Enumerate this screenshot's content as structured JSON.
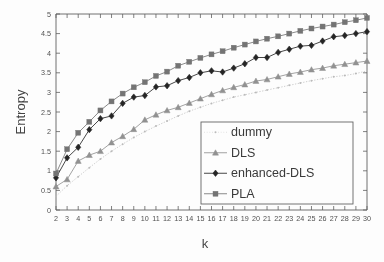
{
  "chart_data": {
    "type": "line",
    "title": "",
    "xlabel": "k",
    "ylabel": "Entropy",
    "xlim": [
      2,
      30
    ],
    "ylim": [
      0,
      5
    ],
    "grid": false,
    "legend_position": "bottom-right",
    "x": [
      2,
      3,
      4,
      5,
      6,
      7,
      8,
      9,
      10,
      11,
      12,
      13,
      14,
      15,
      16,
      17,
      18,
      19,
      20,
      21,
      22,
      23,
      24,
      25,
      26,
      27,
      28,
      29,
      30
    ],
    "xticklabels": [
      "2",
      "3",
      "4",
      "5",
      "6",
      "7",
      "8",
      "9",
      "10",
      "11",
      "12",
      "13",
      "14",
      "15",
      "16",
      "17",
      "18",
      "19",
      "20",
      "21",
      "22",
      "23",
      "24",
      "25",
      "26",
      "27",
      "28",
      "29",
      "30"
    ],
    "yticklabels": [
      "0",
      "0.5",
      "1",
      "1.5",
      "2",
      "2.5",
      "3",
      "3.5",
      "4",
      "4.5",
      "5"
    ],
    "yticks": [
      0,
      0.5,
      1,
      1.5,
      2,
      2.5,
      3,
      3.5,
      4,
      4.5,
      5
    ],
    "series": [
      {
        "name": "dummy",
        "marker": "dot",
        "color": "#b9b9b9",
        "linestyle": "dotted",
        "values": [
          0.35,
          0.62,
          0.85,
          1.08,
          1.3,
          1.5,
          1.68,
          1.85,
          2.0,
          2.14,
          2.27,
          2.4,
          2.52,
          2.62,
          2.72,
          2.8,
          2.88,
          2.94,
          3.0,
          3.06,
          3.12,
          3.18,
          3.24,
          3.3,
          3.35,
          3.4,
          3.43,
          3.48,
          3.55
        ]
      },
      {
        "name": "DLS",
        "marker": "triangle",
        "color": "#8e8e8e",
        "linestyle": "solid",
        "values": [
          0.6,
          0.78,
          1.25,
          1.4,
          1.5,
          1.72,
          1.88,
          2.06,
          2.3,
          2.43,
          2.54,
          2.62,
          2.73,
          2.84,
          2.95,
          3.05,
          3.13,
          3.2,
          3.29,
          3.33,
          3.4,
          3.47,
          3.52,
          3.58,
          3.62,
          3.68,
          3.72,
          3.76,
          3.8
        ]
      },
      {
        "name": "enhanced-DLS",
        "marker": "diamond",
        "color": "#1d1d1d",
        "linestyle": "solid",
        "values": [
          0.82,
          1.33,
          1.6,
          2.05,
          2.33,
          2.4,
          2.72,
          2.88,
          2.92,
          3.14,
          3.17,
          3.3,
          3.38,
          3.5,
          3.55,
          3.52,
          3.62,
          3.73,
          3.89,
          3.89,
          4.02,
          4.1,
          4.18,
          4.2,
          4.31,
          4.42,
          4.45,
          4.5,
          4.55
        ]
      },
      {
        "name": "PLA",
        "marker": "square",
        "color": "#707070",
        "linestyle": "solid",
        "values": [
          0.93,
          1.55,
          1.97,
          2.25,
          2.54,
          2.77,
          2.97,
          3.13,
          3.26,
          3.42,
          3.53,
          3.68,
          3.78,
          3.88,
          3.97,
          4.05,
          4.14,
          4.22,
          4.3,
          4.37,
          4.43,
          4.5,
          4.57,
          4.63,
          4.68,
          4.73,
          4.79,
          4.84,
          4.9
        ]
      }
    ]
  },
  "axes": {
    "y_title": "Entropy",
    "x_title": "k"
  },
  "legend": {
    "entries": [
      {
        "label": "dummy"
      },
      {
        "label": "DLS"
      },
      {
        "label": "enhanced-DLS"
      },
      {
        "label": "PLA"
      }
    ]
  }
}
